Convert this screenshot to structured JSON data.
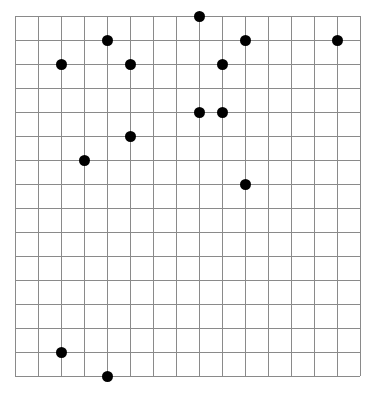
{
  "grid": {
    "columns": 15,
    "rows": 15,
    "origin_x": 15,
    "origin_y": 16,
    "cell_width": 23,
    "cell_height": 24,
    "line_color": "#8a8a8a",
    "dot_color": "#000000",
    "dot_radius": 5.5
  },
  "points": [
    {
      "col": 8,
      "row": 0
    },
    {
      "col": 4,
      "row": 1
    },
    {
      "col": 10,
      "row": 1
    },
    {
      "col": 14,
      "row": 1
    },
    {
      "col": 2,
      "row": 2
    },
    {
      "col": 5,
      "row": 2
    },
    {
      "col": 9,
      "row": 2
    },
    {
      "col": 8,
      "row": 4
    },
    {
      "col": 9,
      "row": 4
    },
    {
      "col": 5,
      "row": 5
    },
    {
      "col": 3,
      "row": 6
    },
    {
      "col": 10,
      "row": 7
    },
    {
      "col": 2,
      "row": 14
    },
    {
      "col": 4,
      "row": 15
    }
  ]
}
